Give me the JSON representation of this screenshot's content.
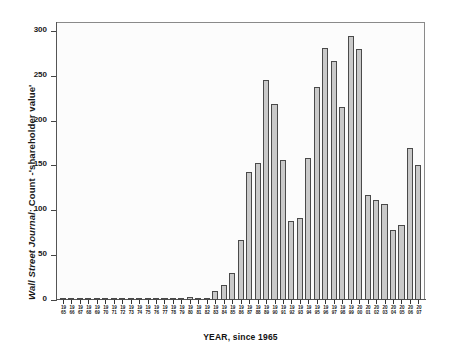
{
  "chart_data": {
    "type": "bar",
    "title": "",
    "ylabel": "Wall Street Journal: Count -'shareholder value'",
    "ylabel_italic_part": "Wall Street Journal",
    "ylabel_rest": ": Count -'shareholder value'",
    "xlabel": "YEAR, since 1965",
    "ylim": [
      0,
      310
    ],
    "yticks": [
      0,
      50,
      100,
      150,
      200,
      250,
      300
    ],
    "ytick_labels": [
      "0",
      "50",
      "100",
      "150",
      "200",
      "250",
      "300"
    ],
    "grid": false,
    "legend": "none",
    "categories": [
      "1965",
      "1966",
      "1967",
      "1968",
      "1969",
      "1970",
      "1971",
      "1972",
      "1973",
      "1974",
      "1975",
      "1976",
      "1977",
      "1978",
      "1979",
      "1980",
      "1981",
      "1982",
      "1983",
      "1984",
      "1985",
      "1986",
      "1987",
      "1988",
      "1989",
      "1990",
      "1991",
      "1992",
      "1993",
      "1994",
      "1995",
      "1996",
      "1997",
      "1998",
      "1999",
      "2000",
      "2001",
      "2002",
      "2003",
      "2004",
      "2005",
      "2006",
      "2007"
    ],
    "xtick_labels_top": [
      "19",
      "19",
      "19",
      "19",
      "19",
      "19",
      "19",
      "19",
      "19",
      "19",
      "19",
      "19",
      "19",
      "19",
      "19",
      "19",
      "19",
      "19",
      "19",
      "19",
      "19",
      "19",
      "19",
      "19",
      "19",
      "19",
      "19",
      "19",
      "19",
      "19",
      "19",
      "19",
      "19",
      "19",
      "19",
      "20",
      "20",
      "20",
      "20",
      "20",
      "20",
      "20",
      "20"
    ],
    "xtick_labels_bottom": [
      "65",
      "66",
      "67",
      "68",
      "69",
      "70",
      "71",
      "72",
      "73",
      "74",
      "75",
      "76",
      "77",
      "78",
      "79",
      "80",
      "81",
      "82",
      "83",
      "84",
      "85",
      "86",
      "87",
      "88",
      "89",
      "90",
      "91",
      "92",
      "93",
      "94",
      "95",
      "96",
      "97",
      "98",
      "99",
      "00",
      "01",
      "02",
      "03",
      "04",
      "05",
      "06",
      "07"
    ],
    "values": [
      1,
      1,
      1,
      1,
      1,
      1,
      1,
      1,
      1,
      1,
      1,
      1,
      1,
      1,
      1,
      3,
      2,
      2,
      10,
      17,
      30,
      67,
      143,
      153,
      245,
      219,
      156,
      88,
      92,
      158,
      237,
      281,
      267,
      215,
      294,
      280,
      117,
      111,
      107,
      78,
      84,
      170,
      151
    ],
    "bar_color": "#c9c9c9",
    "bar_edge_color": "#4a4a4a",
    "axis_color": "#555555",
    "background_color": "#ffffff",
    "plot_background_color": "#fcfcfc"
  }
}
